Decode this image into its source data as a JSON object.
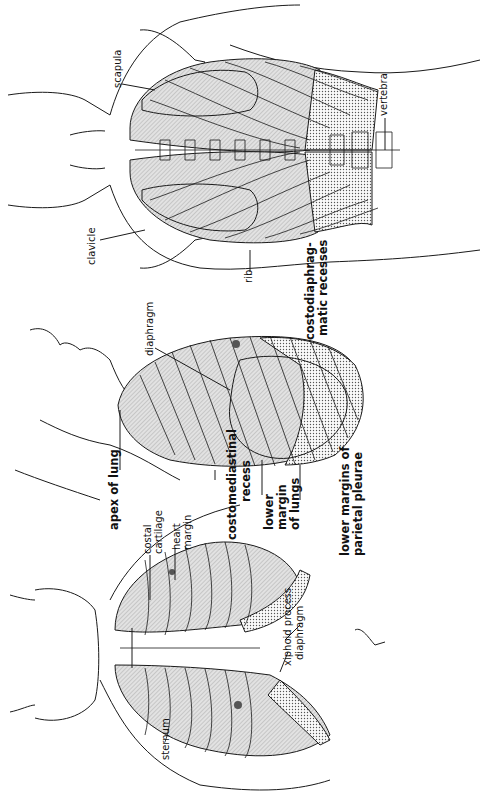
{
  "figure": {
    "orientation": "rotated 90deg counter-clockwise",
    "views": [
      {
        "id": "posterior",
        "name": "posterior view"
      },
      {
        "id": "lateral",
        "name": "lateral view"
      },
      {
        "id": "anterior",
        "name": "anterior view"
      }
    ],
    "colors": {
      "line": "#1a1a1a",
      "lung_fill": "#d9d9d9",
      "recess_fill": "#c4c4c4",
      "background": "#ffffff"
    }
  },
  "labels": {
    "scapula": "scapula",
    "vertebra": "vertebra",
    "clavicle": "clavicle",
    "rib": "rib",
    "costodiaphragmatic_1": "costodiaphrag-",
    "costodiaphragmatic_2": "matic recesses",
    "diaphragm_lateral": "diaphragm",
    "apex_of_lung": "apex of lung",
    "costomediastinal_1": "costomediastinal",
    "costomediastinal_2": "recess",
    "lower_margin_1": "lower",
    "lower_margin_2": "margin",
    "lower_margin_3": "of lungs",
    "parietal_1": "lower margins of",
    "parietal_2": "parietal pleurae",
    "costal_1": "costal",
    "costal_2": "cartilage",
    "heart_1": "heart",
    "heart_2": "margin",
    "xiphoid": "xiphoid process",
    "diaphragm_anterior": "diaphragm",
    "sternum": "sternum"
  }
}
